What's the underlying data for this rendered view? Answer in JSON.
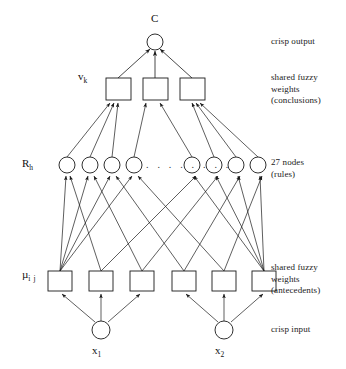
{
  "diagram": {
    "type": "neural-network-diagram",
    "ink_color": "#1a1a1a",
    "background_color": "#ffffff"
  },
  "labels": {
    "output_node": "C",
    "conclusion_weights": "v",
    "conclusion_weights_sub": "k",
    "rule_nodes": "R",
    "rule_nodes_sub": "h",
    "antecedent_weights": "µ",
    "antecedent_weights_sub": "i j",
    "input_1": "x",
    "input_1_sub": "1",
    "input_2": "x",
    "input_2_sub": "2",
    "ellipsis": ". . . . . . . ."
  },
  "right_annotations": [
    {
      "id": "crisp-output",
      "text": "crisp output",
      "x": 271,
      "y": 36
    },
    {
      "id": "shared-fuzzy-weights-conclusions",
      "text": "shared fuzzy\nweights\n(conclusions)",
      "x": 271,
      "y": 72
    },
    {
      "id": "rule-count",
      "text": "27 nodes\n(rules)",
      "x": 271,
      "y": 157
    },
    {
      "id": "shared-fuzzy-weights-antecedents",
      "text": "shared fuzzy\nweights\n(antecedents)",
      "x": 271,
      "y": 262
    },
    {
      "id": "crisp-input",
      "text": "crisp input",
      "x": 271,
      "y": 324
    }
  ],
  "layers": {
    "output": {
      "name": "crisp output node",
      "nodes": [
        {
          "id": "C",
          "cx": 155,
          "cy": 42,
          "r": 8
        }
      ]
    },
    "conclusions": {
      "name": "shared fuzzy weights (conclusions)",
      "count": 3,
      "nodes": [
        {
          "id": "v1",
          "x": 106,
          "y": 78,
          "w": 25,
          "h": 22
        },
        {
          "id": "v2",
          "x": 143,
          "y": 78,
          "w": 25,
          "h": 22
        },
        {
          "id": "v3",
          "x": 180,
          "y": 78,
          "w": 25,
          "h": 22
        }
      ]
    },
    "rules": {
      "name": "rule nodes",
      "count_label": "27 nodes",
      "visible_count": 8,
      "nodes": [
        {
          "id": "R1",
          "cx": 67,
          "cy": 165,
          "r": 8
        },
        {
          "id": "R2",
          "cx": 90,
          "cy": 165,
          "r": 8
        },
        {
          "id": "R3",
          "cx": 112,
          "cy": 165,
          "r": 8
        },
        {
          "id": "R4",
          "cx": 134,
          "cy": 165,
          "r": 8
        },
        {
          "id": "R24",
          "cx": 192,
          "cy": 165,
          "r": 8
        },
        {
          "id": "R25",
          "cx": 214,
          "cy": 165,
          "r": 8
        },
        {
          "id": "R26",
          "cx": 236,
          "cy": 165,
          "r": 8
        },
        {
          "id": "R27",
          "cx": 258,
          "cy": 165,
          "r": 8
        }
      ]
    },
    "antecedents": {
      "name": "shared fuzzy weights (antecedents)",
      "count": 6,
      "nodes": [
        {
          "id": "m11",
          "x": 48,
          "y": 271,
          "w": 24,
          "h": 20
        },
        {
          "id": "m12",
          "x": 89,
          "y": 271,
          "w": 24,
          "h": 20
        },
        {
          "id": "m13",
          "x": 130,
          "y": 271,
          "w": 24,
          "h": 20
        },
        {
          "id": "m21",
          "x": 172,
          "y": 271,
          "w": 24,
          "h": 20
        },
        {
          "id": "m22",
          "x": 212,
          "y": 271,
          "w": 24,
          "h": 20
        },
        {
          "id": "m23",
          "x": 252,
          "y": 271,
          "w": 24,
          "h": 20
        }
      ]
    },
    "inputs": {
      "name": "crisp input nodes",
      "count": 2,
      "nodes": [
        {
          "id": "x1",
          "cx": 101,
          "cy": 330,
          "r": 9
        },
        {
          "id": "x2",
          "cx": 224,
          "cy": 330,
          "r": 9
        }
      ]
    }
  },
  "edges": {
    "rules_to_conclusions": "each visible rule node connects upward to one of the three conclusion weight boxes",
    "conclusions_to_output": "all three conclusion weight boxes connect to the crisp output node C",
    "antecedents_to_rules": "antecedent weight boxes fan out to the rule nodes, crossing between the two input groups",
    "inputs_to_antecedents": "each crisp input node connects to its own group of three antecedent weight boxes"
  }
}
